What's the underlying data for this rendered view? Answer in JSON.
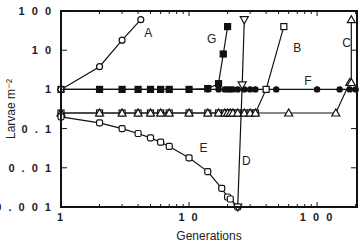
{
  "chart_data": {
    "type": "line",
    "title": "",
    "xlabel": "Generations",
    "ylabel": "Larvae m⁻²",
    "xscale": "log",
    "yscale": "log",
    "xlim": [
      1,
      205
    ],
    "ylim": [
      0.001,
      100
    ],
    "xticks": [
      {
        "value": 1,
        "label": "1"
      },
      {
        "value": 10,
        "label": "1 0"
      },
      {
        "value": 100,
        "label": "1 0 0"
      }
    ],
    "yticks": [
      {
        "value": 100,
        "label": "1 0 0"
      },
      {
        "value": 10,
        "label": "1 0"
      },
      {
        "value": 1,
        "label": "1"
      },
      {
        "value": 0.1,
        "label": "0 . 1"
      },
      {
        "value": 0.01,
        "label": "0 . 0 1"
      },
      {
        "value": 0.001,
        "label": "0 . 0 0 1"
      }
    ],
    "grid": false,
    "series": [
      {
        "name": "A",
        "marker": "open-circle",
        "x": [
          1,
          2,
          3,
          4.2
        ],
        "y": [
          1,
          3.8,
          18,
          60
        ],
        "label_at": [
          4.8,
          22
        ]
      },
      {
        "name": "B",
        "marker": "open-square",
        "x": [
          1,
          2,
          3,
          4,
          5,
          6,
          7,
          10,
          14,
          17,
          19,
          20,
          21,
          22,
          24,
          27,
          30,
          33,
          40,
          55
        ],
        "y": [
          0.25,
          0.25,
          0.25,
          0.25,
          0.25,
          0.25,
          0.25,
          0.25,
          0.25,
          0.25,
          0.25,
          0.25,
          0.25,
          0.25,
          0.25,
          0.25,
          0.25,
          0.25,
          1,
          40
        ],
        "label_at": [
          70,
          9
        ]
      },
      {
        "name": "C",
        "marker": "open-triangle-up",
        "x": [
          1,
          2,
          3,
          4,
          5,
          6,
          7,
          10,
          14,
          17,
          19,
          20,
          21,
          22,
          24,
          27,
          30,
          33,
          60,
          140,
          180,
          185,
          185
        ],
        "y": [
          0.25,
          0.25,
          0.25,
          0.25,
          0.25,
          0.25,
          0.25,
          0.25,
          0.25,
          0.25,
          0.25,
          0.25,
          0.25,
          0.25,
          0.25,
          0.25,
          0.25,
          0.25,
          0.25,
          0.25,
          1.5,
          1.5,
          60
        ],
        "label_at": [
          170,
          12
        ]
      },
      {
        "name": "D",
        "marker": "open-triangle-down",
        "x": [
          24,
          26,
          27
        ],
        "y": [
          0.001,
          1.3,
          60
        ],
        "label_at": [
          28,
          0.012
        ]
      },
      {
        "name": "E",
        "marker": "open-circle-square",
        "x": [
          1,
          2,
          3,
          4,
          5,
          6,
          7,
          10,
          14,
          18,
          20,
          21,
          24
        ],
        "y": [
          0.2,
          0.14,
          0.1,
          0.075,
          0.058,
          0.045,
          0.035,
          0.018,
          0.008,
          0.003,
          0.0018,
          0.0016,
          0.001
        ],
        "label_at": [
          13,
          0.025
        ]
      },
      {
        "name": "F",
        "marker": "filled-circle",
        "x": [
          1,
          2,
          3,
          4,
          5,
          6,
          7,
          10,
          14,
          17,
          19,
          20,
          21,
          22,
          24,
          27,
          30,
          33,
          40,
          48,
          100,
          150,
          180,
          200
        ],
        "y": [
          1,
          1,
          1,
          1,
          1,
          1,
          1,
          1,
          1,
          1,
          1,
          1,
          1,
          1,
          1,
          1,
          1,
          1,
          1,
          1,
          1,
          1,
          1,
          1
        ],
        "label_at": [
          85,
          1.3
        ]
      },
      {
        "name": "G",
        "marker": "filled-square",
        "x": [
          1,
          2,
          3,
          4,
          5,
          6,
          7,
          10,
          14,
          17,
          18.5,
          20
        ],
        "y": [
          1,
          1,
          1,
          1,
          1,
          1,
          1,
          1,
          1.05,
          1.4,
          8,
          40
        ],
        "label_at": [
          15,
          15
        ]
      }
    ]
  }
}
